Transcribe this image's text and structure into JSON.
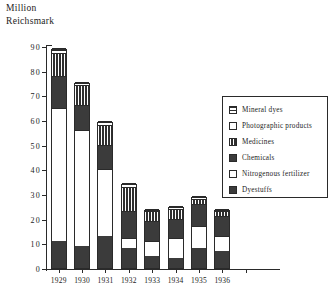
{
  "chart_data": {
    "type": "bar",
    "title": "",
    "ylabel": "Million Reichsmark",
    "xlabel": "",
    "ylim": [
      0,
      90
    ],
    "ytick_step": 10,
    "grid": false,
    "stacked": true,
    "legend_position": "right",
    "categories": [
      "1929",
      "1930",
      "1931",
      "1932",
      "1933",
      "1934",
      "1935",
      "1936"
    ],
    "yticks": [
      "0",
      "10",
      "20",
      "30",
      "40",
      "50",
      "60",
      "70",
      "80",
      "90"
    ],
    "series": [
      {
        "name": "Dyestuffs",
        "pattern": "solid",
        "values": [
          11,
          9,
          13,
          8,
          5,
          4,
          8,
          7
        ]
      },
      {
        "name": "Nitrogenous fertilizer",
        "pattern": "empty",
        "values": [
          54,
          47,
          27,
          4,
          6,
          8,
          9,
          6
        ]
      },
      {
        "name": "Chemicals",
        "pattern": "solid",
        "values": [
          13,
          10,
          10,
          11,
          8,
          8,
          9,
          8
        ]
      },
      {
        "name": "Medicines",
        "pattern": "vertical-stripes",
        "values": [
          9,
          8,
          8,
          10,
          4,
          4,
          2,
          2
        ]
      },
      {
        "name": "Photographic products",
        "pattern": "empty",
        "values": [
          1.5,
          1,
          1,
          1,
          0.6,
          0.6,
          0.6,
          0.6
        ]
      },
      {
        "name": "Mineral dyes",
        "pattern": "horizontal-stripes",
        "values": [
          0.5,
          0.5,
          0.5,
          0.5,
          0.4,
          0.4,
          0.4,
          0.4
        ]
      }
    ],
    "totals": [
      89,
      75.5,
      59.5,
      34.5,
      24,
      25,
      29,
      24
    ]
  },
  "axis_title_lines": [
    "Million",
    "Reichsmark"
  ],
  "legend": {
    "entries": [
      {
        "label": "Mineral  dyes",
        "pattern": "horizontal-stripes"
      },
      {
        "label": "Photographic   products",
        "pattern": "empty"
      },
      {
        "label": "Medicines",
        "pattern": "vertical-stripes"
      },
      {
        "label": "Chemicals",
        "pattern": "solid"
      },
      {
        "label": "Nitrogenous   fertilizer",
        "pattern": "empty"
      },
      {
        "label": "Dyestuffs",
        "pattern": "solid"
      }
    ]
  },
  "colors": {
    "ink": "#2a2a2a",
    "fill_dark": "#3b3b3b",
    "fill_light": "#ffffff",
    "background": "#ffffff"
  }
}
